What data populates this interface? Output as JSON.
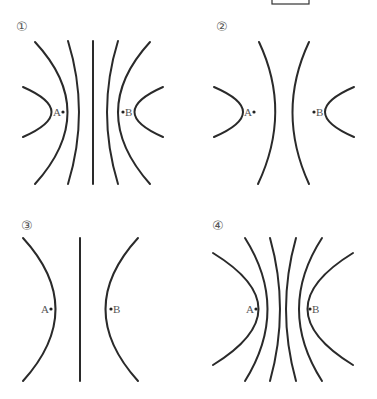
{
  "header": {
    "answer_box": ""
  },
  "panels": [
    {
      "number": "①",
      "label_a": "A",
      "label_b": "B",
      "description": "Electric field lines between two equal opposite charges, 5 lines with straight center line"
    },
    {
      "number": "②",
      "label_a": "A",
      "label_b": "B",
      "description": "Field lines: 2 curves near charges, 2 middle curves"
    },
    {
      "number": "③",
      "label_a": "A",
      "label_b": "B",
      "description": "Field lines: two curves and a straight center line"
    },
    {
      "number": "④",
      "label_a": "A",
      "label_b": "B",
      "description": "Field lines: 6 curves, no straight center line"
    }
  ]
}
